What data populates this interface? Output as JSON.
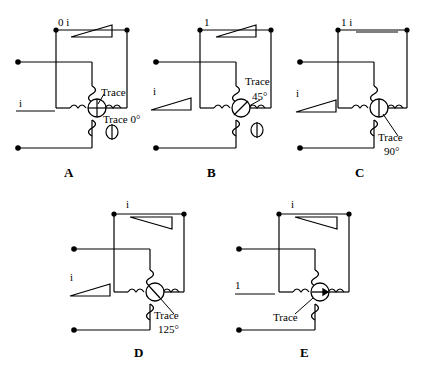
{
  "figure": {
    "type": "multiple-choice-circuit-diagram",
    "panel_count": 5
  },
  "panels": [
    {
      "letter": "A",
      "top_label": "0  i",
      "left_label": "i",
      "trace_label": "Trace",
      "trace_angle_label": "Trace 0°",
      "meter_needle_deg": 0,
      "meter_style": "cross",
      "has_second_meter": true,
      "top_phasor": "rising",
      "left_phasor": "none",
      "second_phasor": "none"
    },
    {
      "letter": "B",
      "top_label": "1",
      "left_label": "i",
      "trace_label": "Trace",
      "trace_angle_label": "45°",
      "meter_needle_deg": 45,
      "meter_style": "needle",
      "has_second_meter": true,
      "top_phasor": "rising",
      "left_phasor": "rising",
      "second_phasor": "none"
    },
    {
      "letter": "C",
      "top_label": "1  i",
      "left_label": "i",
      "trace_label": "Trace",
      "trace_angle_label": "90°",
      "meter_needle_deg": 90,
      "meter_style": "needle",
      "has_second_meter": false,
      "top_phasor": "flat",
      "left_phasor": "rising",
      "second_phasor": "none"
    },
    {
      "letter": "D",
      "top_label": "i",
      "left_label": "i",
      "trace_label": "Trace",
      "trace_angle_label": "125°",
      "meter_needle_deg": 125,
      "meter_style": "needle",
      "has_second_meter": false,
      "top_phasor": "falling",
      "left_phasor": "rising",
      "second_phasor": "none"
    },
    {
      "letter": "E",
      "top_label": "i",
      "left_label": "1",
      "trace_label": "Trace",
      "trace_angle_label": "",
      "meter_needle_deg": 0,
      "meter_style": "arrow-right",
      "has_second_meter": false,
      "top_phasor": "falling",
      "left_phasor": "flat",
      "second_phasor": "none"
    }
  ],
  "colors": {
    "line": "#000000",
    "background": "#ffffff"
  }
}
